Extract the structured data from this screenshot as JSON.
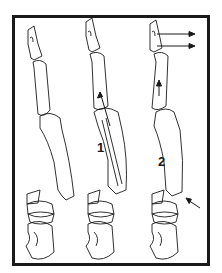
{
  "figure": {
    "type": "line-art anatomical diagram",
    "panels": [
      {
        "id": "a",
        "description": "fractured phalanges, displaced"
      },
      {
        "id": "b",
        "label": "1",
        "description": "longitudinal traction arrow along shaft"
      },
      {
        "id": "c",
        "label": "2",
        "description": "axial arrow, lateral arrows at tip, pressure arrow at base"
      }
    ],
    "labels": {
      "one": "1",
      "two": "2"
    },
    "colors": {
      "stroke": "#1a1a1a",
      "background": "#ffffff",
      "frame": "#1a1a1a"
    }
  }
}
